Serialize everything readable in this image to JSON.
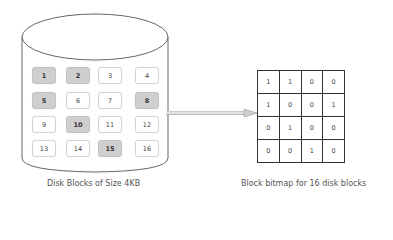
{
  "disk": {
    "caption": "Disk Blocks of Size 4KB",
    "blocks": [
      {
        "label": "1",
        "used": true
      },
      {
        "label": "2",
        "used": true
      },
      {
        "label": "3",
        "used": false
      },
      {
        "label": "4",
        "used": false
      },
      {
        "label": "5",
        "used": true
      },
      {
        "label": "6",
        "used": false
      },
      {
        "label": "7",
        "used": false
      },
      {
        "label": "8",
        "used": true
      },
      {
        "label": "9",
        "used": false
      },
      {
        "label": "10",
        "used": true
      },
      {
        "label": "11",
        "used": false
      },
      {
        "label": "12",
        "used": false
      },
      {
        "label": "13",
        "used": false
      },
      {
        "label": "14",
        "used": false
      },
      {
        "label": "15",
        "used": true
      },
      {
        "label": "16",
        "used": false
      }
    ],
    "used_color": "#cfcfcf"
  },
  "bitmap": {
    "caption": "Block bitmap for 16 disk blocks",
    "rows": [
      [
        "1",
        "1",
        "0",
        "0"
      ],
      [
        "1",
        "0",
        "0",
        "1"
      ],
      [
        "0",
        "1",
        "0",
        "0"
      ],
      [
        "0",
        "0",
        "1",
        "0"
      ]
    ]
  },
  "arrow": {
    "direction": "right",
    "icon": "arrow-right-icon"
  }
}
